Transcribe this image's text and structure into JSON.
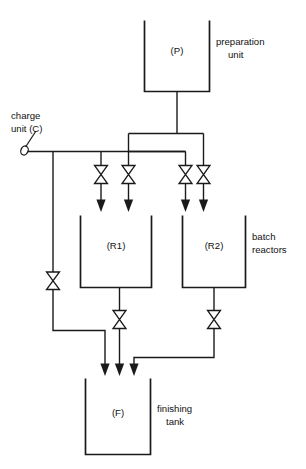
{
  "diagram": {
    "stroke_color": "#1a1a1a",
    "background_color": "#ffffff",
    "vessels": [
      {
        "id": "P",
        "tag": "(P)",
        "label_line1": "preparation",
        "label_line2": "unit"
      },
      {
        "id": "R1",
        "tag": "(R1)",
        "label_line1": "batch",
        "label_line2": "reactors"
      },
      {
        "id": "R2",
        "tag": "(R2)",
        "label_line1": "",
        "label_line2": ""
      },
      {
        "id": "F",
        "tag": "(F)",
        "label_line1": "finishing",
        "label_line2": "tank"
      }
    ],
    "annotations": {
      "charge_unit_line1": "charge",
      "charge_unit_line2": "unit (C)",
      "preparation_line1": "preparation",
      "preparation_line2": "unit",
      "batch_line1": "batch",
      "batch_line2": "reactors",
      "finishing_line1": "finishing",
      "finishing_line2": "tank"
    },
    "tags": {
      "p": "(P)",
      "r1": "(R1)",
      "r2": "(R2)",
      "f": "(F)"
    },
    "valve_count_feed": 4,
    "valve_count_drain": 3,
    "icons": {
      "valve": "bowtie-valve-icon",
      "charge": "charge-point-icon",
      "arrow": "flow-arrow-icon"
    }
  }
}
